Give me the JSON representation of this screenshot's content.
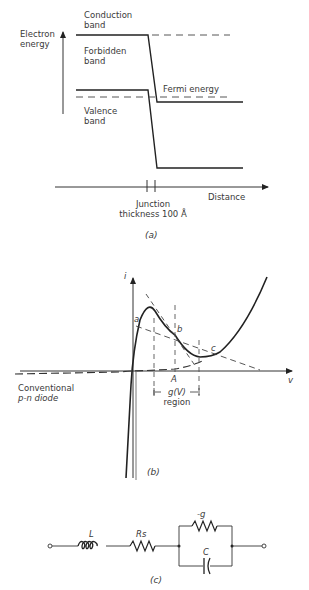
{
  "panel_a": {
    "y_axis_label_line1": "Electron",
    "y_axis_label_line2": "energy",
    "conduction_line1": "Conduction",
    "conduction_line2": "band",
    "forbidden_line1": "Forbidden",
    "forbidden_line2": "band",
    "valence_line1": "Valence",
    "valence_line2": "band",
    "fermi_label": "Fermi energy",
    "x_axis_label": "Distance",
    "junction_line1": "Junction",
    "junction_line2": "thickness 100 Å",
    "caption": "(a)"
  },
  "panel_b": {
    "y_axis_label": "i",
    "x_axis_label": "v",
    "point_a": "a",
    "point_b": "b",
    "point_c": "c",
    "point_A": "A",
    "diode_line1": "Conventional",
    "diode_line2": "p-n diode",
    "region_label1": "g(V)",
    "region_label2": "region",
    "caption": "(b)"
  },
  "panel_c": {
    "inductor_label": "L",
    "series_resistor_label": "Rs",
    "negative_conductance_label": "-g",
    "capacitor_label": "C",
    "caption": "(c)"
  }
}
